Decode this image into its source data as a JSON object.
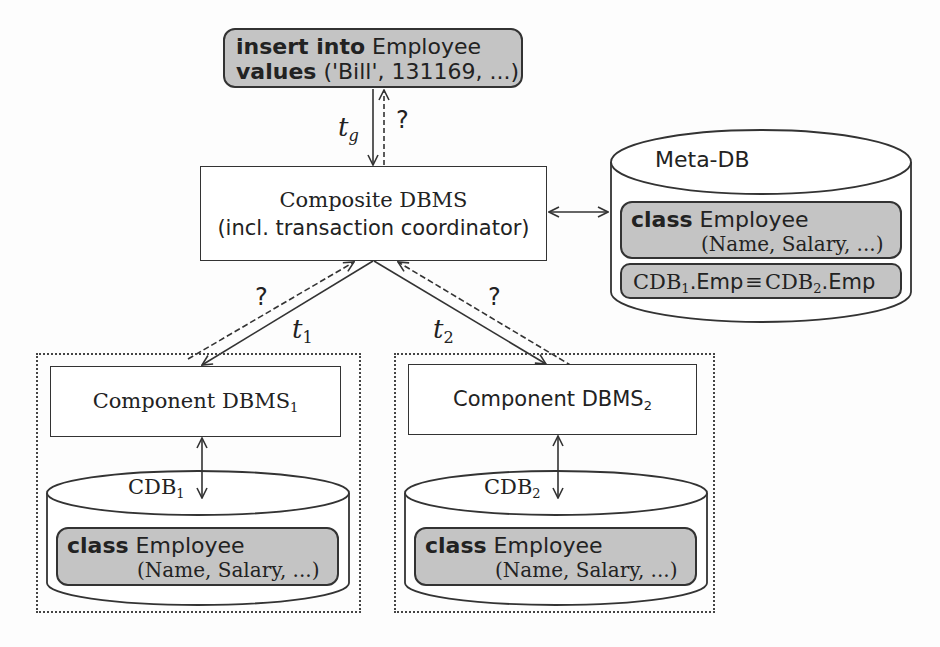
{
  "query_box": {
    "line1_keyword": "insert into",
    "line1_rest": " Employee",
    "line2_keyword": "values",
    "line2_rest": " ('Bill', 131169, ...)"
  },
  "composite": {
    "line1": "Composite DBMS",
    "line2": "(incl. transaction coordinator)"
  },
  "meta_db": {
    "title": "Meta-DB",
    "class_keyword": "class",
    "class_name": " Employee",
    "class_attrs": "(Name, Salary, ...)",
    "mapping_left": "CDB",
    "mapping_left_sub": "1",
    "mapping_left_rest": ".Emp",
    "mapping_op": "≡",
    "mapping_right": "CDB",
    "mapping_right_sub": "2",
    "mapping_right_rest": ".Emp"
  },
  "arrows": {
    "tg_label": "t",
    "tg_sub": "g",
    "t1_label": "t",
    "t1_sub": "1",
    "t2_label": "t",
    "t2_sub": "2",
    "unknown": "?"
  },
  "component1": {
    "label": "Component DBMS",
    "sub": "1",
    "db_label": "CDB",
    "db_sub": "1",
    "class_keyword": "class",
    "class_name": " Employee",
    "class_attrs": "(Name, Salary, ...)"
  },
  "component2": {
    "label": "Component DBMS",
    "sub": "2",
    "db_label": "CDB",
    "db_sub": "2",
    "class_keyword": "class",
    "class_name": " Employee",
    "class_attrs": "(Name, Salary, ...)"
  },
  "colors": {
    "gray_fill": "#c4c4c4",
    "stroke": "#333333"
  }
}
